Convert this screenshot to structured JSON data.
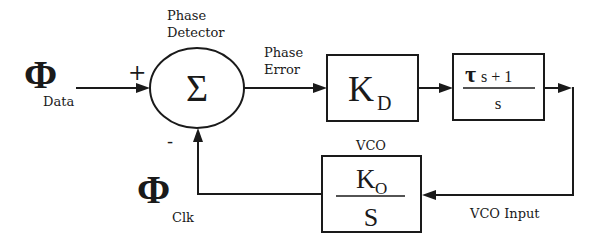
{
  "diagram": {
    "input": {
      "symbol": "Φ",
      "subscript": "Data",
      "sign": "+"
    },
    "feedback_input": {
      "symbol": "Φ",
      "subscript": "Clk",
      "sign": "-"
    },
    "phase_detector": {
      "label_line1": "Phase",
      "label_line2": "Detector",
      "symbol": "Σ"
    },
    "phase_error": {
      "label_line1": "Phase",
      "label_line2": "Error"
    },
    "detector_gain": {
      "symbol": "K",
      "subscript": "D"
    },
    "loop_filter": {
      "numerator_tau": "τ",
      "numerator_rest": "s + 1",
      "denominator": "s"
    },
    "vco": {
      "label": "VCO",
      "numerator_symbol": "K",
      "numerator_subscript": "O",
      "denominator": "S"
    },
    "vco_input": {
      "label": "VCO Input"
    }
  }
}
